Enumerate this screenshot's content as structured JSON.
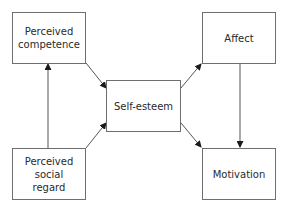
{
  "diagram": {
    "nodes": [
      {
        "id": "competence",
        "label": "Perceived\ncompetence"
      },
      {
        "id": "social_regard",
        "label": "Perceived\nsocial\nregard"
      },
      {
        "id": "self_esteem",
        "label": "Self-esteem"
      },
      {
        "id": "affect",
        "label": "Affect"
      },
      {
        "id": "motivation",
        "label": "Motivation"
      }
    ],
    "edges": [
      {
        "from": "social_regard",
        "to": "competence"
      },
      {
        "from": "competence",
        "to": "self_esteem"
      },
      {
        "from": "social_regard",
        "to": "self_esteem"
      },
      {
        "from": "self_esteem",
        "to": "affect"
      },
      {
        "from": "self_esteem",
        "to": "motivation"
      },
      {
        "from": "affect",
        "to": "motivation"
      }
    ],
    "colors": {
      "stroke": "#6e6e6e",
      "arrow": "#1a1a1a",
      "text": "#2a2a2a"
    }
  }
}
